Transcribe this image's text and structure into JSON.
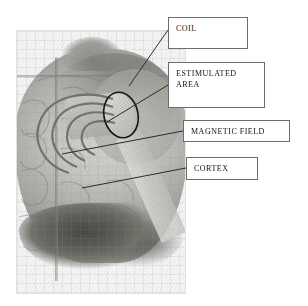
{
  "figure": {
    "type": "labeled-anatomical-diagram",
    "background_color": "#ffffff"
  },
  "photo": {
    "description": "grayscale photograph of a human brain seen from behind-left",
    "frame_border_color": "#e2e2e2"
  },
  "overlay": {
    "coil_color": "#c9c9c4",
    "field_line_color": "#7a7a76",
    "ellipse_color": "#1a1a1a",
    "leader_line_color": "#2b2b2b"
  },
  "callouts": [
    {
      "id": "coil",
      "label": "COIL",
      "lines": [
        "COIL"
      ],
      "box": {
        "x": 168,
        "y": 17,
        "w": 80,
        "h": 32
      },
      "leader": {
        "x1": 168,
        "y1": 30,
        "x2": 129,
        "y2": 86
      }
    },
    {
      "id": "estimulated-area",
      "label": "ESTIMULATED AREA",
      "lines": [
        "ESTIMULATED",
        "AREA"
      ],
      "box": {
        "x": 168,
        "y": 62,
        "w": 97,
        "h": 46
      },
      "leader": {
        "x1": 168,
        "y1": 85,
        "x2": 107,
        "y2": 122
      }
    },
    {
      "id": "magnetic-field",
      "label": "MAGNETIC FIELD",
      "lines": [
        "MAGNETIC FIELD"
      ],
      "box": {
        "x": 183,
        "y": 120,
        "w": 107,
        "h": 22
      },
      "leader": {
        "x1": 183,
        "y1": 131,
        "x2": 62,
        "y2": 154
      }
    },
    {
      "id": "cortex",
      "label": "CORTEX",
      "lines": [
        "CORTEX"
      ],
      "box": {
        "x": 186,
        "y": 157,
        "w": 72,
        "h": 23
      },
      "leader": {
        "x1": 186,
        "y1": 168,
        "x2": 82,
        "y2": 188
      }
    }
  ],
  "annotations": {
    "field_arc_count": 4,
    "stimulated_area_marker": "ellipse"
  }
}
